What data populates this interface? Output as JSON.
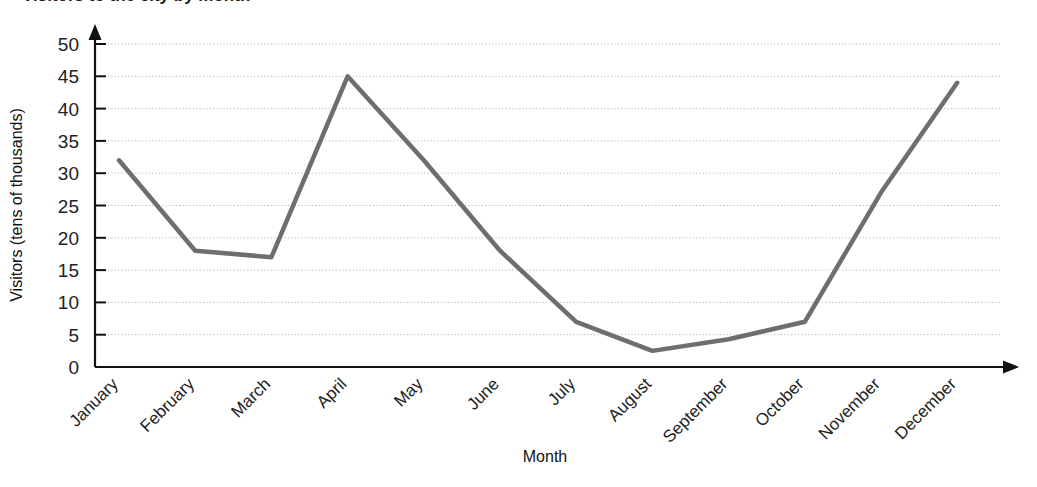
{
  "chart_data": {
    "type": "line",
    "title": "Visitors to the city by month",
    "xlabel": "Month",
    "ylabel": "Visitors (tens of thousands)",
    "categories": [
      "January",
      "February",
      "March",
      "April",
      "May",
      "June",
      "July",
      "August",
      "September",
      "October",
      "November",
      "December"
    ],
    "values": [
      32,
      18,
      17,
      45,
      32,
      18,
      7,
      2.5,
      4.3,
      7,
      27,
      44
    ],
    "series": [
      {
        "name": "Visitors",
        "values": [
          32,
          18,
          17,
          45,
          32,
          18,
          7,
          2.5,
          4.3,
          7,
          27,
          44
        ],
        "color": "#6e6e6e"
      }
    ],
    "ylim": [
      0,
      50
    ],
    "ytick_step": 5,
    "yticks": [
      0,
      5,
      10,
      15,
      20,
      25,
      30,
      35,
      40,
      45,
      50
    ],
    "xlim": [
      0,
      13
    ],
    "grid": "horizontal-dotted",
    "legend": "none",
    "line_color": "#6e6e6e",
    "line_width": 4.5,
    "axis_color": "#111111",
    "x_label_rotation": -45
  },
  "axes": {
    "y_title": "Visitors (tens of thousands)",
    "x_title": "Month"
  }
}
